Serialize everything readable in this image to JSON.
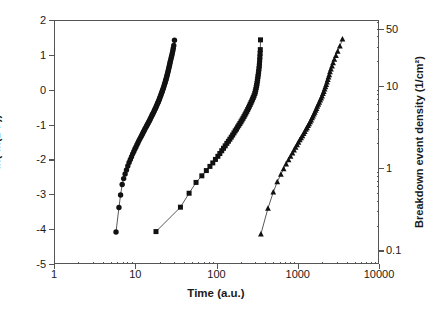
{
  "chart_data": {
    "type": "scatter",
    "title": "",
    "xlabel": "Time (a.u.)",
    "ylabel": "ln(-ln(1-F))",
    "y2label": "Breakdown event density (1/cm²)",
    "xscale": "log",
    "yscale": "linear",
    "y2scale": "log",
    "xlim": [
      1,
      10000
    ],
    "ylim": [
      -5,
      2
    ],
    "y2lim": [
      0.0683,
      63.5
    ],
    "grid": false,
    "legend": "none",
    "xticklabels": [
      "1",
      "10",
      "100",
      "1000",
      "10000"
    ],
    "xtickvalues": [
      1,
      10,
      100,
      1000,
      10000
    ],
    "yticklabels": [
      "2",
      "1",
      "0",
      "-1",
      "-2",
      "-3",
      "-4",
      "-5"
    ],
    "ytickvalues": [
      2,
      1,
      0,
      -1,
      -2,
      -3,
      -4,
      -5
    ],
    "y2ticklabels": [
      "50",
      "10",
      "1",
      "0.1"
    ],
    "y2tickvalues": [
      50,
      10,
      1,
      0.1
    ],
    "series": [
      {
        "name": "Sample A",
        "marker": "circle",
        "color": "#111111",
        "linked": true,
        "x": [
          5.8,
          6.3,
          6.6,
          6.9,
          7.2,
          7.5,
          7.8,
          8.1,
          8.4,
          8.7,
          9.0,
          9.3,
          9.6,
          9.9,
          10.2,
          10.5,
          10.8,
          11.1,
          11.4,
          11.7,
          12.0,
          12.3,
          12.6,
          12.9,
          13.2,
          13.5,
          13.8,
          14.1,
          14.4,
          14.7,
          15.0,
          15.3,
          15.6,
          15.9,
          16.2,
          16.5,
          16.8,
          17.1,
          17.4,
          17.7,
          18.0,
          18.3,
          18.6,
          18.9,
          19.2,
          19.5,
          19.8,
          20.1,
          20.4,
          20.7,
          21.0,
          21.3,
          21.6,
          21.9,
          22.2,
          22.5,
          22.8,
          23.1,
          23.4,
          23.7,
          24.0,
          24.3,
          24.6,
          24.9,
          25.2,
          25.5,
          25.8,
          26.1,
          26.4,
          26.7,
          27.0,
          27.4,
          27.8,
          28.2,
          28.6,
          29.0,
          29.4,
          29.8,
          30.4
        ],
        "y": [
          -4.08,
          -3.38,
          -3.02,
          -2.72,
          -2.55,
          -2.42,
          -2.3,
          -2.19,
          -2.09,
          -2.0,
          -1.92,
          -1.84,
          -1.77,
          -1.7,
          -1.64,
          -1.58,
          -1.52,
          -1.46,
          -1.41,
          -1.36,
          -1.31,
          -1.26,
          -1.21,
          -1.17,
          -1.12,
          -1.08,
          -1.04,
          -1.0,
          -0.96,
          -0.92,
          -0.88,
          -0.84,
          -0.8,
          -0.76,
          -0.72,
          -0.69,
          -0.65,
          -0.61,
          -0.57,
          -0.54,
          -0.5,
          -0.46,
          -0.42,
          -0.38,
          -0.35,
          -0.31,
          -0.27,
          -0.23,
          -0.19,
          -0.15,
          -0.11,
          -0.07,
          -0.03,
          0.01,
          0.05,
          0.09,
          0.14,
          0.18,
          0.22,
          0.27,
          0.31,
          0.36,
          0.41,
          0.45,
          0.5,
          0.55,
          0.6,
          0.65,
          0.7,
          0.76,
          0.81,
          0.87,
          0.93,
          0.99,
          1.05,
          1.12,
          1.19,
          1.27,
          1.42
        ]
      },
      {
        "name": "Sample B",
        "marker": "square",
        "color": "#111111",
        "linked": true,
        "x": [
          18,
          36,
          46,
          56,
          66,
          75,
          83,
          90,
          97,
          104,
          110,
          116,
          122,
          128,
          134,
          140,
          146,
          152,
          158,
          164,
          170,
          176,
          182,
          188,
          194,
          200,
          206,
          212,
          218,
          224,
          230,
          236,
          242,
          248,
          254,
          260,
          266,
          272,
          278,
          284,
          290,
          296,
          300,
          304,
          308,
          312,
          315,
          318,
          321,
          324,
          327,
          330,
          333,
          336,
          338,
          340,
          342,
          344,
          346,
          348
        ],
        "y": [
          -4.07,
          -3.37,
          -2.97,
          -2.66,
          -2.47,
          -2.32,
          -2.2,
          -2.1,
          -2.0,
          -1.91,
          -1.83,
          -1.75,
          -1.68,
          -1.61,
          -1.54,
          -1.48,
          -1.42,
          -1.36,
          -1.3,
          -1.24,
          -1.18,
          -1.13,
          -1.07,
          -1.02,
          -0.97,
          -0.92,
          -0.87,
          -0.82,
          -0.77,
          -0.72,
          -0.67,
          -0.62,
          -0.57,
          -0.52,
          -0.47,
          -0.42,
          -0.37,
          -0.32,
          -0.27,
          -0.22,
          -0.17,
          -0.11,
          -0.06,
          0.0,
          0.06,
          0.12,
          0.18,
          0.25,
          0.31,
          0.38,
          0.45,
          0.52,
          0.6,
          0.68,
          0.76,
          0.85,
          0.94,
          1.04,
          1.15,
          1.43
        ]
      },
      {
        "name": "Sample C",
        "marker": "triangle",
        "color": "#111111",
        "linked": true,
        "x": [
          352,
          430,
          500,
          560,
          620,
          670,
          720,
          770,
          815,
          860,
          900,
          940,
          980,
          1020,
          1060,
          1100,
          1140,
          1180,
          1220,
          1260,
          1300,
          1340,
          1380,
          1420,
          1460,
          1500,
          1540,
          1580,
          1620,
          1660,
          1700,
          1740,
          1790,
          1840,
          1890,
          1940,
          1990,
          2040,
          2090,
          2140,
          2190,
          2240,
          2290,
          2340,
          2390,
          2440,
          2490,
          2560,
          2640,
          2720,
          2820,
          2950,
          3100,
          3300,
          3550
        ],
        "y": [
          -4.14,
          -3.4,
          -2.94,
          -2.64,
          -2.43,
          -2.27,
          -2.13,
          -2.01,
          -1.91,
          -1.82,
          -1.73,
          -1.65,
          -1.58,
          -1.51,
          -1.44,
          -1.38,
          -1.32,
          -1.26,
          -1.2,
          -1.14,
          -1.09,
          -1.03,
          -0.98,
          -0.92,
          -0.87,
          -0.81,
          -0.76,
          -0.7,
          -0.65,
          -0.59,
          -0.54,
          -0.48,
          -0.42,
          -0.36,
          -0.3,
          -0.24,
          -0.18,
          -0.11,
          -0.05,
          0.02,
          0.08,
          0.15,
          0.22,
          0.29,
          0.36,
          0.43,
          0.51,
          0.59,
          0.68,
          0.77,
          0.87,
          0.98,
          1.1,
          1.25,
          1.45
        ]
      }
    ]
  }
}
